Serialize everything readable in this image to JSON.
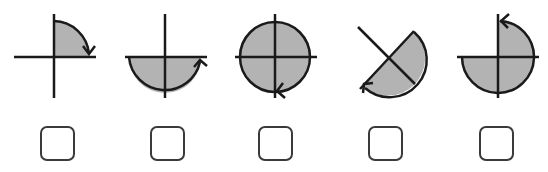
{
  "colors": {
    "stroke": "#1a1a1a",
    "fill": "#b3b3b3",
    "checkbox_border": "#3a3a3a"
  },
  "options": [
    {
      "id": "option-1",
      "label": "Quarter turn clockwise (90°)",
      "shaded": "upper-right quadrant",
      "arrow": "clockwise",
      "checked": false
    },
    {
      "id": "option-2",
      "label": "Half turn (180°)",
      "shaded": "lower half",
      "arrow": "counterclockwise",
      "checked": false
    },
    {
      "id": "option-3",
      "label": "Full turn (360°)",
      "shaded": "full circle",
      "arrow": "counterclockwise",
      "checked": false
    },
    {
      "id": "option-4",
      "label": "Half turn on diagonal (180°)",
      "shaded": "lower-right half (diagonal)",
      "arrow": "clockwise",
      "checked": false
    },
    {
      "id": "option-5",
      "label": "Three-quarter turn (270°)",
      "shaded": "upper-right, lower-left, lower-right quadrants",
      "arrow": "counterclockwise",
      "checked": false
    }
  ]
}
